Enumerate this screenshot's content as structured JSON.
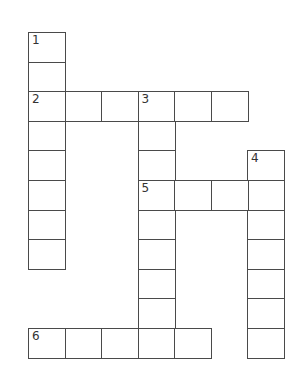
{
  "puzzle": {
    "type": "crossword",
    "origin": {
      "x": 28,
      "y": 32
    },
    "cell_width": 36.5,
    "cell_height": 29.6,
    "line_color": "#4a4a4a",
    "rows": 11,
    "cols": 7,
    "entries": [
      {
        "number": "1",
        "direction": "down",
        "row": 0,
        "col": 0,
        "length": 8
      },
      {
        "number": "2",
        "direction": "across",
        "row": 2,
        "col": 0,
        "length": 6
      },
      {
        "number": "3",
        "direction": "down",
        "row": 2,
        "col": 3,
        "length": 9
      },
      {
        "number": "4",
        "direction": "down",
        "row": 4,
        "col": 6,
        "length": 7
      },
      {
        "number": "5",
        "direction": "across",
        "row": 5,
        "col": 3,
        "length": 4
      },
      {
        "number": "6",
        "direction": "across",
        "row": 10,
        "col": 0,
        "length": 5
      }
    ]
  }
}
